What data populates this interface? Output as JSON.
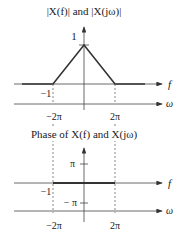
{
  "magnitude_plot": {
    "title": "|X(f)| and |X(jω)|",
    "peak_label": "1",
    "f_axis_label": "f",
    "omega_axis_label": "ω",
    "f_ticks": [
      "−1",
      "1"
    ],
    "omega_ticks": [
      "−2π",
      "2π"
    ]
  },
  "phase_plot": {
    "title": "Phase of X(f) and X(jω)",
    "pi_label": "π",
    "neg_pi_label": "− π",
    "f_axis_label": "f",
    "omega_axis_label": "ω",
    "f_ticks": [
      "−1",
      "1"
    ],
    "omega_ticks": [
      "−2π",
      "2π"
    ]
  },
  "colors": {
    "line": "#333333",
    "axis": "#444444"
  }
}
